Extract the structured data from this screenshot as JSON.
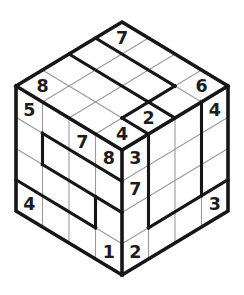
{
  "figure": {
    "type": "sudoku-cube-3d",
    "grid_size": 4,
    "faces": [
      "top",
      "left",
      "right"
    ],
    "givens": {
      "top": [
        {
          "r": 0,
          "c": 0,
          "v": "7"
        },
        {
          "r": 3,
          "c": 0,
          "v": "8"
        },
        {
          "r": 0,
          "c": 3,
          "v": "6"
        },
        {
          "r": 2,
          "c": 3,
          "v": "2"
        },
        {
          "r": 3,
          "c": 3,
          "v": "4"
        }
      ],
      "left": [
        {
          "r": 0,
          "c": 0,
          "v": "5"
        },
        {
          "r": 0,
          "c": 2,
          "v": "7"
        },
        {
          "r": 0,
          "c": 3,
          "v": "8"
        },
        {
          "r": 3,
          "c": 0,
          "v": "4"
        },
        {
          "r": 3,
          "c": 3,
          "v": "1"
        }
      ],
      "right": [
        {
          "r": 0,
          "c": 0,
          "v": "3"
        },
        {
          "r": 1,
          "c": 0,
          "v": "7"
        },
        {
          "r": 0,
          "c": 3,
          "v": "4"
        },
        {
          "r": 3,
          "c": 0,
          "v": "2"
        },
        {
          "r": 3,
          "c": 3,
          "v": "3"
        }
      ]
    },
    "region_borders": [
      {
        "face": "top",
        "dir": "row",
        "index": 1,
        "from": 0,
        "to": 3
      },
      {
        "face": "top",
        "dir": "row",
        "index": 2,
        "from": 0,
        "to": 4
      },
      {
        "face": "top",
        "dir": "col",
        "index": 3,
        "from": 1,
        "to": 3
      },
      {
        "face": "top",
        "dir": "row",
        "index": 3,
        "from": 3,
        "to": 4
      },
      {
        "face": "left",
        "dir": "row",
        "index": 1,
        "from": 1,
        "to": 4
      },
      {
        "face": "left",
        "dir": "row",
        "index": 2,
        "from": 1,
        "to": 4
      },
      {
        "face": "left",
        "dir": "col",
        "index": 1,
        "from": 1,
        "to": 2
      },
      {
        "face": "left",
        "dir": "col",
        "index": 3,
        "from": 2,
        "to": 3
      },
      {
        "face": "left",
        "dir": "row",
        "index": 3,
        "from": 0,
        "to": 3
      },
      {
        "face": "right",
        "dir": "col",
        "index": 1,
        "from": 0,
        "to": 3
      },
      {
        "face": "right",
        "dir": "col",
        "index": 3,
        "from": 0,
        "to": 3
      },
      {
        "face": "right",
        "dir": "row",
        "index": 3,
        "from": 1,
        "to": 4
      }
    ],
    "geometry": {
      "canvas": [
        244,
        295
      ],
      "top_vertex": [
        122,
        22
      ],
      "left_vertex": [
        16,
        86
      ],
      "right_vertex": [
        228,
        86
      ],
      "center_vertex": [
        122,
        150
      ],
      "bottom_vertex": [
        122,
        275
      ]
    },
    "style": {
      "background": "#ffffff",
      "face_fill": "#ffffff",
      "bold_color": "#161616",
      "thin_color": "#9a9a9a",
      "digit_color": "#1c1c1c",
      "outer_width": 3.6,
      "bold_width": 3.1,
      "thin_width": 1.1,
      "digit_size": 17.5
    }
  }
}
